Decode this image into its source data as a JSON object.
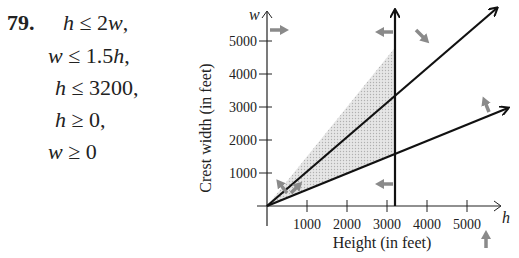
{
  "problem": {
    "number": "79.",
    "inequalities": [
      {
        "lhs": "h",
        "op": "≤",
        "rhs": "2w,",
        "left": 63,
        "top": 10
      },
      {
        "lhs": "w",
        "op": "≤",
        "rhs": "1.5h,",
        "left": 48,
        "top": 43
      },
      {
        "lhs": "h",
        "op": "≤",
        "rhs": "3200,",
        "left": 55,
        "top": 75
      },
      {
        "lhs": "h",
        "op": "≥",
        "rhs": "0,",
        "left": 55,
        "top": 107
      },
      {
        "lhs": "w",
        "op": "≥",
        "rhs": "0",
        "left": 48,
        "top": 139
      }
    ]
  },
  "chart_data": {
    "type": "line",
    "title": "",
    "xlabel": "Height (in feet)",
    "ylabel": "Crest width (in feet)",
    "x_axis_var": "h",
    "y_axis_var": "w",
    "xlim": [
      0,
      5800
    ],
    "ylim": [
      0,
      5800
    ],
    "xticks": [
      1000,
      2000,
      3000,
      4000,
      5000
    ],
    "yticks": [
      1000,
      2000,
      3000,
      4000,
      5000
    ],
    "grid": false,
    "series": [
      {
        "name": "w = 1.5h",
        "x": [
          0,
          3200,
          3900
        ],
        "y": [
          0,
          4800,
          5850
        ]
      },
      {
        "name": "h = 2w",
        "x": [
          0,
          3200,
          6000
        ],
        "y": [
          0,
          1600,
          3000
        ]
      },
      {
        "name": "h = 3200",
        "x": [
          3200,
          3200
        ],
        "y": [
          0,
          5900
        ]
      }
    ],
    "feasible_region": {
      "vertices": [
        [
          0,
          0
        ],
        [
          3200,
          1600
        ],
        [
          3200,
          4800
        ]
      ],
      "fill": "#d9d9d9"
    },
    "direction_arrows": [
      {
        "near": "w axis top",
        "direction": "right",
        "meaning": "h ≥ 0"
      },
      {
        "near": "h axis right",
        "direction": "up",
        "meaning": "w ≥ 0"
      },
      {
        "near": "h = 3200 line",
        "direction": "left",
        "meaning": "h ≤ 3200"
      },
      {
        "near": "w = 1.5h line",
        "direction": "down-right",
        "meaning": "w ≤ 1.5h"
      },
      {
        "near": "h = 2w line",
        "direction": "up-left",
        "meaning": "h ≤ 2w"
      }
    ],
    "colors": {
      "axis": "#222222",
      "line": "#111111",
      "arrow": "#8a8a8a",
      "region": "#d9d9d9"
    }
  }
}
